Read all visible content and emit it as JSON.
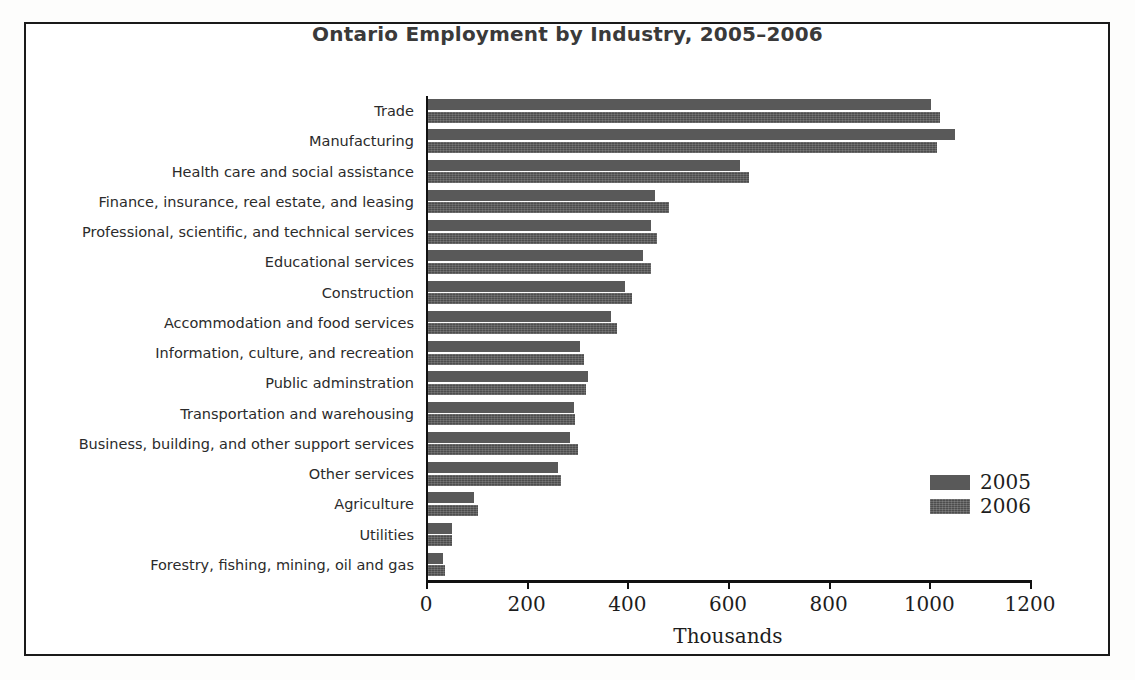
{
  "chart_data": {
    "type": "bar",
    "orientation": "horizontal",
    "title": "Ontario Employment by Industry, 2005–2006",
    "xlabel": "Thousands",
    "ylabel": "",
    "xlim": [
      0,
      1200
    ],
    "xticks": [
      0,
      200,
      400,
      600,
      800,
      1000,
      1200
    ],
    "xtick_labels": [
      "0",
      "200",
      "400",
      "600",
      "800",
      "1000",
      "1200"
    ],
    "grid": false,
    "legend_position": "lower right",
    "categories": [
      "Trade",
      "Manufacturing",
      "Health care and social assistance",
      "Finance, insurance, real estate, and leasing",
      "Professional, scientific, and technical services",
      "Educational services",
      "Construction",
      "Accommodation and food services",
      "Information, culture, and recreation",
      "Public adminstration",
      "Transportation and warehousing",
      "Business, building, and other support services",
      "Other services",
      "Agriculture",
      "Utilities",
      "Forestry, fishing, mining, oil and gas"
    ],
    "series": [
      {
        "name": "2005",
        "color": "#595959",
        "values": [
          1000,
          1048,
          620,
          450,
          443,
          428,
          392,
          363,
          302,
          318,
          290,
          283,
          258,
          92,
          48,
          30
        ]
      },
      {
        "name": "2006",
        "color": "#4d4d4d",
        "values": [
          1018,
          1012,
          638,
          478,
          455,
          443,
          405,
          375,
          310,
          313,
          293,
          298,
          265,
          100,
          47,
          33
        ]
      }
    ]
  },
  "legend": {
    "items": [
      {
        "label": "2005",
        "swatch": "series-2005-swatch"
      },
      {
        "label": "2006",
        "swatch": "series-2006-swatch"
      }
    ]
  }
}
